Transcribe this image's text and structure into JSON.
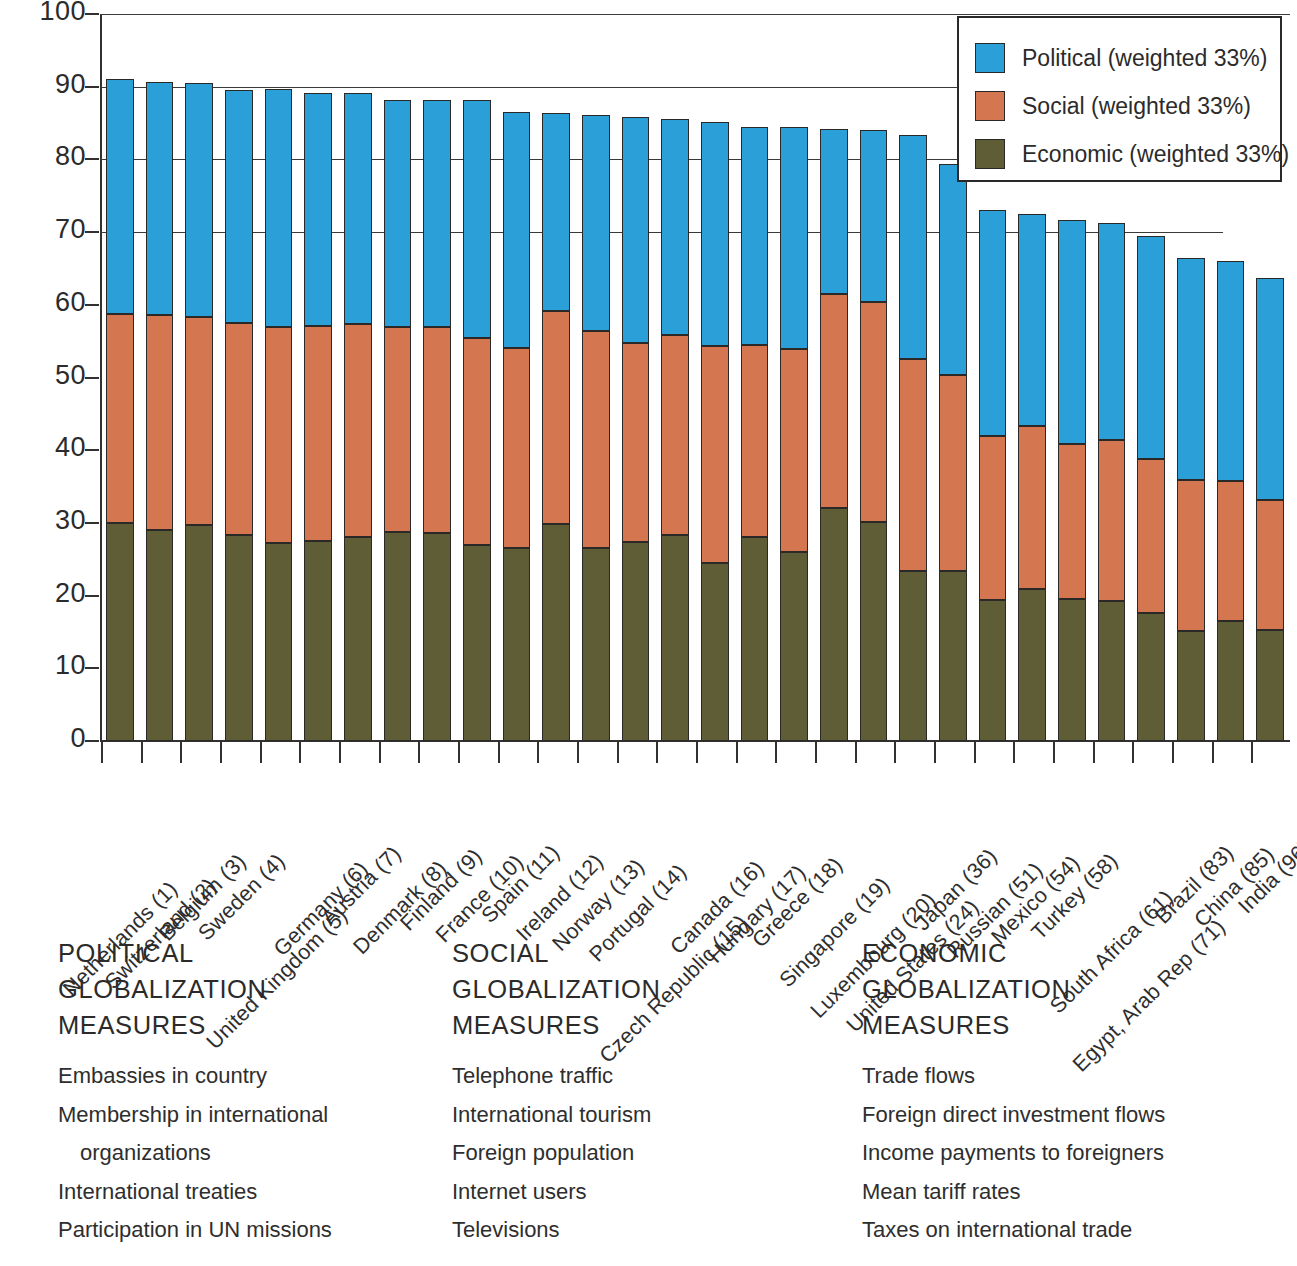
{
  "chart_data": {
    "type": "bar",
    "subtype": "stacked-bar",
    "title": "",
    "xlabel": "",
    "ylabel": "",
    "ylim": [
      0,
      100
    ],
    "yticks": [
      0,
      10,
      20,
      30,
      40,
      50,
      60,
      70,
      80,
      90,
      100
    ],
    "grid": "horizontal-partial",
    "legend_position": "top-right",
    "stack_order_bottom_to_top": [
      "Economic",
      "Social",
      "Political"
    ],
    "categories": [
      "Netherlands (1)",
      "Switzerland (2)",
      "Belgium (3)",
      "Sweden (4)",
      "United Kingdom (5)",
      "Germany (6)",
      "Austria (7)",
      "Denmark (8)",
      "Finland (9)",
      "France (10)",
      "Spain (11)",
      "Ireland (12)",
      "Norway (13)",
      "Portugal (14)",
      "Czech Republic (15)",
      "Canada (16)",
      "Hungary (17)",
      "Greece (18)",
      "Singapore (19)",
      "Luxembourg (20)",
      "United States (24)",
      "Japan (36)",
      "Russian (51)",
      "Mexico (54)",
      "Turkey (58)",
      "South Africa (61)",
      "Egypt, Arab Rep (71)",
      "Brazil (83)",
      "China (85)",
      "India (96)"
    ],
    "series": [
      {
        "name": "Economic (weighted 33%)",
        "color": "#5e5d35",
        "values": [
          30.0,
          29.0,
          29.7,
          28.3,
          27.3,
          27.5,
          28.0,
          28.7,
          28.6,
          27.0,
          26.6,
          29.9,
          26.6,
          27.4,
          28.4,
          24.5,
          28.1,
          26.0,
          32.1,
          30.1,
          23.4,
          23.4,
          19.4,
          20.9,
          19.5,
          19.3,
          17.6,
          15.2,
          16.5,
          15.3
        ]
      },
      {
        "name": "Social (weighted 33%)",
        "color": "#d4764f",
        "values": [
          28.7,
          29.6,
          28.6,
          29.2,
          29.6,
          29.6,
          29.4,
          28.3,
          28.4,
          28.4,
          27.4,
          29.2,
          29.8,
          27.4,
          27.4,
          29.8,
          26.4,
          27.9,
          29.4,
          30.3,
          29.1,
          26.9,
          22.6,
          22.4,
          21.4,
          22.1,
          21.2,
          20.7,
          19.2,
          17.8
        ]
      },
      {
        "name": "Political (weighted 33%)",
        "color": "#2a9fd8",
        "values": [
          32.3,
          32.0,
          32.2,
          32.0,
          32.8,
          32.0,
          31.7,
          31.2,
          31.2,
          32.8,
          32.5,
          27.3,
          29.7,
          31.1,
          29.8,
          30.8,
          30.0,
          30.5,
          22.7,
          23.7,
          30.8,
          29.1,
          31.0,
          29.2,
          30.8,
          29.9,
          30.6,
          30.5,
          30.3,
          30.6
        ]
      }
    ],
    "totals": [
      91.0,
      90.6,
      90.5,
      89.5,
      89.7,
      89.1,
      89.1,
      88.2,
      88.2,
      88.2,
      86.5,
      86.4,
      86.1,
      85.9,
      85.6,
      85.1,
      84.5,
      84.4,
      84.2,
      84.1,
      83.3,
      79.4,
      73.0,
      72.5,
      71.7,
      71.3,
      69.4,
      66.0,
      66.0,
      63.7
    ]
  },
  "legend": {
    "items": [
      {
        "label": "Political (weighted 33%)",
        "color": "#2a9fd8"
      },
      {
        "label": "Social (weighted 33%)",
        "color": "#d4764f"
      },
      {
        "label": "Economic (weighted 33%)",
        "color": "#5e5d35"
      }
    ]
  },
  "measures": {
    "columns": [
      {
        "title": "POLITICAL\nGLOBALIZATION\nMEASURES",
        "items": [
          "Embassies in country",
          "Membership in international",
          "organizations",
          "International treaties",
          "Participation in UN missions"
        ],
        "indent_flags": [
          false,
          false,
          true,
          false,
          false
        ]
      },
      {
        "title": "SOCIAL\nGLOBALIZATION\nMEASURES",
        "items": [
          "Telephone traffic",
          "International tourism",
          "Foreign population",
          "Internet users",
          "Televisions"
        ],
        "indent_flags": [
          false,
          false,
          false,
          false,
          false
        ]
      },
      {
        "title": "ECONOMIC\nGLOBALIZATION\nMEASURES",
        "items": [
          "Trade flows",
          "Foreign direct investment flows",
          "Income payments to foreigners",
          "Mean tariff rates",
          "Taxes on international trade"
        ],
        "indent_flags": [
          false,
          false,
          false,
          false,
          false
        ]
      }
    ]
  },
  "axis": {
    "y_tick_labels": [
      "0",
      "10",
      "20",
      "30",
      "40",
      "50",
      "60",
      "70",
      "80",
      "90",
      "100"
    ]
  }
}
